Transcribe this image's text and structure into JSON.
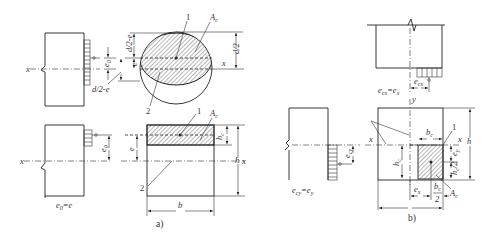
{
  "figure": {
    "panel_a": {
      "caption": "a)",
      "circle_section": {
        "labels": {
          "one": "1",
          "two": "2",
          "Ac": "A",
          "Ac_sub": "c",
          "d2e": "d/2-e",
          "d2e_left": "d/2-e",
          "d2": "d/2",
          "e": "e",
          "e0": "e",
          "e0_sub": "0",
          "x": "x"
        },
        "column_x": "x"
      },
      "rect_section": {
        "labels": {
          "one": "1",
          "two": "2",
          "Ac": "A",
          "Ac_sub": "c",
          "hc": "h",
          "hc_sub": "c",
          "e": "e",
          "h": "h",
          "x": "x",
          "b": "b",
          "e0": "e",
          "e0_sub": "0"
        },
        "column_x": "x",
        "column_caption": "e",
        "column_caption_sub": "0",
        "column_caption_rest": "=e"
      }
    },
    "panel_b": {
      "caption": "b)",
      "top_column": {
        "ecx": "e",
        "ecx_sub": "cx",
        "caption": "e",
        "caption_sub": "cx",
        "caption_rest": "=e",
        "caption_rest_sub": "x"
      },
      "left_column": {
        "ecy": "e",
        "ecy_sub": "cy",
        "caption": "e",
        "caption_sub": "cy",
        "caption_rest": "=e",
        "caption_rest_sub": "y"
      },
      "section": {
        "labels": {
          "y": "y",
          "x_left": "x",
          "x_right": "x",
          "one": "1",
          "bc": "b",
          "bc_sub": "c",
          "hc": "h",
          "hc_sub": "c",
          "ey": "e",
          "ey_sub": "y",
          "hc2": "h",
          "hc2_sub": "c",
          "hc2_den": "2",
          "h": "h",
          "ex": "e",
          "ex_sub": "x",
          "bc2": "b",
          "bc2_sub": "c",
          "bc2_den": "2",
          "Ac": "A",
          "Ac_sub": "c"
        }
      }
    }
  }
}
